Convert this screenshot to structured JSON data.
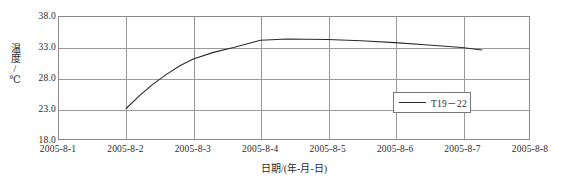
{
  "chart_data": {
    "type": "line",
    "title": "",
    "xlabel": "日期/(年-月-日)",
    "ylabel": "温度/℃",
    "x_categories": [
      "2005-8-1",
      "2005-8-2",
      "2005-8-3",
      "2005-8-4",
      "2005-8-5",
      "2005-8-6",
      "2005-8-7",
      "2005-8-8"
    ],
    "y_ticks": [
      "18.0",
      "23.0",
      "28.0",
      "33.0",
      "38.0"
    ],
    "ylim": [
      18.0,
      38.0
    ],
    "xlim": [
      "2005-8-1",
      "2005-8-8"
    ],
    "grid": true,
    "legend_position": "bottom-right",
    "series": [
      {
        "name": "T19－22",
        "color": "#2a2a2a",
        "x": [
          "2005-8-2",
          "2005-8-2.2",
          "2005-8-2.4",
          "2005-8-2.6",
          "2005-8-2.8",
          "2005-8-3",
          "2005-8-3.3",
          "2005-8-3.6",
          "2005-8-4",
          "2005-8-4.4",
          "2005-8-5",
          "2005-8-5.5",
          "2005-8-6",
          "2005-8-6.5",
          "2005-8-7",
          "2005-8-7.3"
        ],
        "values": [
          23.0,
          25.1,
          27.0,
          28.6,
          30.0,
          31.1,
          32.2,
          33.0,
          34.2,
          34.4,
          34.3,
          34.1,
          33.8,
          33.4,
          33.0,
          32.6
        ]
      }
    ]
  },
  "legend": {
    "entries": [
      {
        "label": "T19－22"
      }
    ]
  },
  "axes": {
    "y_title": "温度/℃",
    "x_title": "日期/(年-月-日)",
    "y_tick_labels": [
      "38.0",
      "33.0",
      "28.0",
      "23.0",
      "18.0"
    ],
    "x_tick_labels": [
      "2005-8-1",
      "2005-8-2",
      "2005-8-3",
      "2005-8-4",
      "2005-8-5",
      "2005-8-6",
      "2005-8-7",
      "2005-8-8"
    ]
  },
  "colors": {
    "series_line": "#2a2a2a",
    "grid": "#9a9a9a",
    "axis": "#8a8a8a",
    "text": "#2b2b2b",
    "background": "#ffffff"
  }
}
